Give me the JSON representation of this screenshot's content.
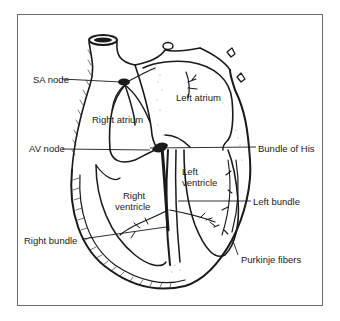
{
  "diagram": {
    "type": "anatomical illustration",
    "colors": {
      "line": "#1a1a1a",
      "frame": "#6a6a6a",
      "background": "#ffffff",
      "stipple": "#9a9a9a"
    },
    "callout_labels": {
      "sa_node": "SA node",
      "av_node": "AV node",
      "right_bundle": "Right bundle",
      "bundle_of_his": "Bundle of His",
      "left_bundle": "Left bundle",
      "purkinje_fibers": "Purkinje fibers"
    },
    "region_labels": {
      "left_atrium": "Left atrium",
      "right_atrium": "Right atrium",
      "left_ventricle_1": "Left",
      "left_ventricle_2": "ventricle",
      "right_ventricle_1": "Right",
      "right_ventricle_2": "ventricle"
    }
  }
}
